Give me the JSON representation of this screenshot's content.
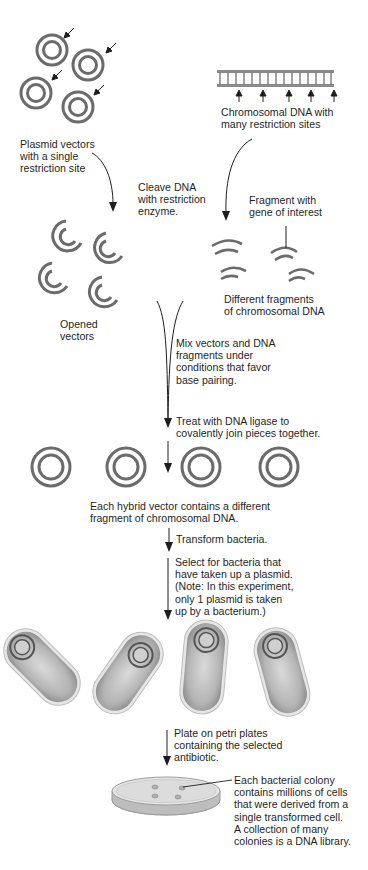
{
  "diagram": {
    "colors": {
      "ring": "#6b6b6b",
      "line": "#1e1e1e",
      "ladder": "#7a7a7a",
      "bacterium_body": "#a8a8a8",
      "bacterium_inner": "#d6d6d6",
      "petri": "#c8c8c8"
    },
    "labels": {
      "plasmid_vectors": "Plasmid vectors\nwith a single\nrestriction site",
      "chromosomal_dna": "Chromosomal DNA with\nmany restriction sites",
      "cleave": "Cleave DNA\nwith restriction\nenzyme.",
      "fragment_gene": "Fragment with\ngene of interest",
      "opened_vectors": "Opened\nvectors",
      "different_fragments": "Different fragments\nof chromosomal DNA",
      "mix": "Mix vectors and DNA\nfragments under\nconditions that favor\nbase pairing.",
      "ligase": "Treat with DNA ligase to\ncovalently join pieces together.",
      "hybrid": "Each hybrid vector contains a different\nfragment of chromosomal DNA.",
      "transform": "Transform bacteria.",
      "select": "Select for bacteria that\nhave taken up a plasmid.\n(Note: In this experiment,\nonly 1 plasmid is taken\nup by a bacterium.)",
      "plate": "Plate on petri plates\ncontaining the selected\nantibiotic.",
      "colony": "Each bacterial colony\ncontains millions of cells\nthat were derived from a\nsingle transformed cell.\nA collection of many\ncolonies is a DNA library."
    },
    "counts": {
      "plasmid_vectors": 4,
      "restriction_site_arrows": 5,
      "opened_vectors": 4,
      "chromosomal_fragments": 4,
      "hybrid_vectors": 4,
      "bacteria": 4,
      "colonies": 4
    }
  }
}
